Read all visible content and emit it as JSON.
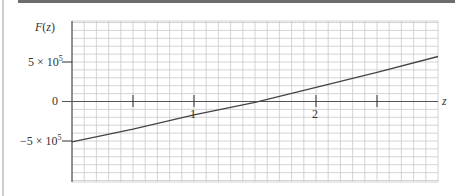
{
  "chart_data": {
    "type": "line",
    "title": "",
    "xlabel": "z",
    "ylabel": "F(z)",
    "xlim": [
      0,
      3
    ],
    "ylim": [
      -1000000,
      1000000
    ],
    "x_ticks": [
      0.5,
      1,
      1.5,
      2,
      2.5
    ],
    "x_tick_labels": [
      "",
      "1",
      "",
      "2",
      ""
    ],
    "y_ticks": [
      500000,
      0,
      -500000
    ],
    "y_tick_labels": [
      "5 × 10^5",
      "0",
      "−5 × 10^5"
    ],
    "grid": true,
    "legend": null,
    "series": [
      {
        "name": "F(z)",
        "x": [
          0,
          0.5,
          1,
          1.5,
          2,
          2.5,
          3
        ],
        "y": [
          -510000,
          -350000,
          -170000,
          -10000,
          180000,
          370000,
          570000
        ]
      }
    ]
  },
  "labels": {
    "y_axis": "F(z)",
    "x_axis": "z",
    "y_tick_pos": "5 × 10",
    "y_tick_pos_exp": "5",
    "y_tick_zero": "0",
    "y_tick_neg": "−5 × 10",
    "y_tick_neg_exp": "5",
    "x_tick_1": "1",
    "x_tick_2": "2"
  }
}
